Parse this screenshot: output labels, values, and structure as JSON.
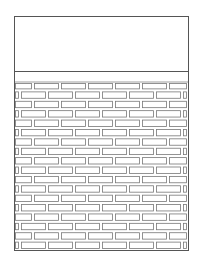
{
  "diagram": {
    "type": "brick-wall-panel",
    "frame": {
      "x": 14,
      "y": 16,
      "width": 174,
      "height": 234,
      "stroke": "#555555"
    },
    "top_panel": {
      "divider_y": 71,
      "label": ""
    },
    "brick_field": {
      "top": 81,
      "bottom": 250,
      "rows": 18,
      "brick_pitch": 27,
      "row_a_offset": 19,
      "row_b_offset": 6,
      "brick_stroke": "#777777",
      "mortar_color": "#cfcfcf"
    }
  }
}
